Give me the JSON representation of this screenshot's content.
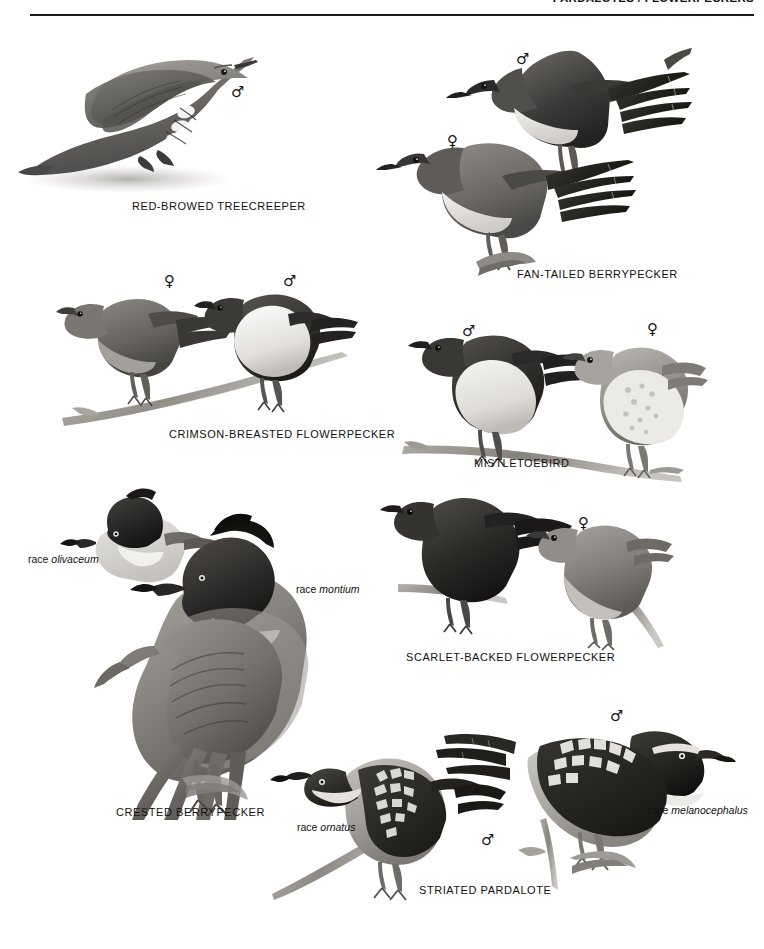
{
  "page": {
    "width": 764,
    "height": 949,
    "background": "#ffffff",
    "ink": "#111111",
    "header": {
      "text": "PARDALOTES / FLOWERPECKERS",
      "clipped": true
    }
  },
  "symbols": {
    "male": "♂",
    "female": "♀"
  },
  "plates": [
    {
      "id": "red-browed-treecreeper",
      "caption": "RED-BROWED TREECREEPER",
      "caption_x": 132,
      "caption_y": 200,
      "birds": [
        {
          "sex": "male",
          "sex_x": 231,
          "sex_y": 85
        }
      ]
    },
    {
      "id": "fan-tailed-berrypecker",
      "caption": "FAN-TAILED BERRYPECKER",
      "caption_x": 517,
      "caption_y": 268,
      "birds": [
        {
          "sex": "male",
          "sex_x": 516,
          "sex_y": 52
        },
        {
          "sex": "female",
          "sex_x": 447,
          "sex_y": 134
        }
      ]
    },
    {
      "id": "crimson-breasted-flowerpecker",
      "caption": "CRIMSON-BREASTED FLOWERPECKER",
      "caption_x": 169,
      "caption_y": 428,
      "birds": [
        {
          "sex": "female",
          "sex_x": 164,
          "sex_y": 274
        },
        {
          "sex": "male",
          "sex_x": 283,
          "sex_y": 274
        }
      ]
    },
    {
      "id": "mistletoebird",
      "caption": "MISTLETOEBIRD",
      "caption_x": 474,
      "caption_y": 457,
      "birds": [
        {
          "sex": "male",
          "sex_x": 462,
          "sex_y": 324
        },
        {
          "sex": "female",
          "sex_x": 647,
          "sex_y": 322
        }
      ]
    },
    {
      "id": "scarlet-backed-flowerpecker",
      "caption": "SCARLET-BACKED FLOWERPECKER",
      "caption_x": 406,
      "caption_y": 651,
      "birds": [
        {
          "sex": "female",
          "sex_x": 578,
          "sex_y": 516
        }
      ]
    },
    {
      "id": "crested-berrypecker",
      "caption": "CRESTED BERRYPECKER",
      "caption_x": 116,
      "caption_y": 806,
      "races": [
        {
          "prefix": "race",
          "name": "olivaceum",
          "x": 28,
          "y": 553
        },
        {
          "prefix": "race",
          "name": "montium",
          "x": 296,
          "y": 583
        }
      ]
    },
    {
      "id": "striated-pardalote",
      "caption": "STRIATED PARDALOTE",
      "caption_x": 419,
      "caption_y": 884,
      "races": [
        {
          "prefix": "race",
          "name": "ornatus",
          "x": 297,
          "y": 821
        },
        {
          "prefix": "race",
          "name": "melanocephalus",
          "x": 648,
          "y": 804
        }
      ],
      "birds": [
        {
          "sex": "male",
          "sex_x": 610,
          "sex_y": 709
        },
        {
          "sex": "male",
          "sex_x": 481,
          "sex_y": 833
        }
      ]
    }
  ]
}
